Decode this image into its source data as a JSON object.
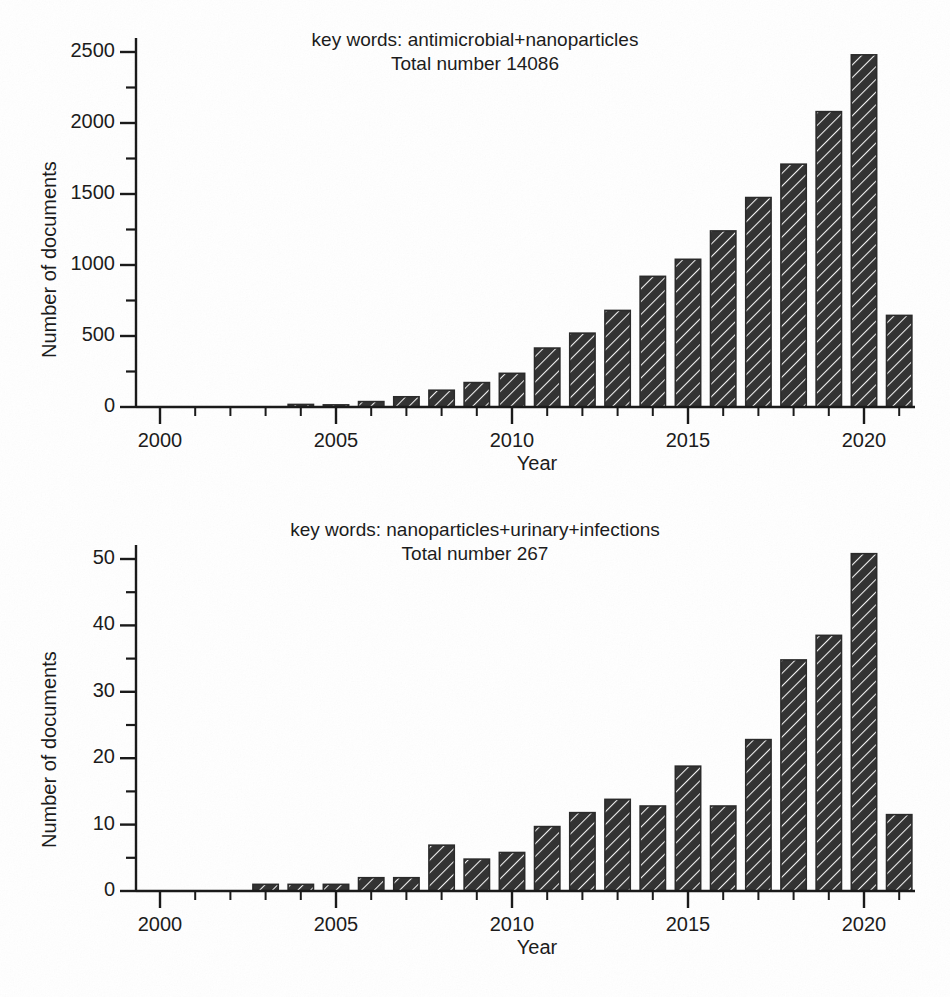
{
  "figure": {
    "background_color": "#ffffff",
    "bar_color": "#333333",
    "bar_hatch": "diagonal-45",
    "axis_color": "#1a1a1a"
  },
  "chart_data": [
    {
      "id": "chart-top",
      "type": "bar",
      "title": "key words: antimicrobial+nanoparticles",
      "subtitle": "Total number 14086",
      "xlabel": "Year",
      "ylabel": "Number of documents",
      "xlim": [
        1999,
        2022.4
      ],
      "ylim": [
        0,
        2600
      ],
      "ytick_labels": [
        "0",
        "500",
        "1000",
        "1500",
        "2000",
        "2500"
      ],
      "yticks": [
        0,
        500,
        1000,
        1500,
        2000,
        2500
      ],
      "yminor_step": 250,
      "xtick_labels": [
        "2000",
        "2005",
        "2010",
        "2015",
        "2020"
      ],
      "xticks": [
        2000,
        2005,
        2010,
        2015,
        2020
      ],
      "xminor_step": 1,
      "grid": false,
      "legend": "none",
      "categories": [
        2004,
        2005,
        2006,
        2007,
        2008,
        2009,
        2010,
        2011,
        2012,
        2013,
        2014,
        2015,
        2016,
        2017,
        2018,
        2019,
        2020,
        2021
      ],
      "values": [
        18,
        15,
        38,
        72,
        118,
        172,
        237,
        415,
        520,
        680,
        920,
        1040,
        1240,
        1475,
        1710,
        2080,
        2480,
        645
      ]
    },
    {
      "id": "chart-bottom",
      "type": "bar",
      "title": "key words: nanoparticles+urinary+infections",
      "subtitle": "Total number 267",
      "xlabel": "Year",
      "ylabel": "Number of documents",
      "xlim": [
        1999,
        2022.4
      ],
      "ylim": [
        0,
        53
      ],
      "ytick_labels": [
        "0",
        "10",
        "20",
        "30",
        "40",
        "50"
      ],
      "yticks": [
        0,
        10,
        20,
        30,
        40,
        50
      ],
      "yminor_step": 5,
      "xtick_labels": [
        "2000",
        "2005",
        "2010",
        "2015",
        "2020"
      ],
      "xticks": [
        2000,
        2005,
        2010,
        2015,
        2020
      ],
      "xminor_step": 1,
      "grid": false,
      "legend": "none",
      "categories": [
        2003,
        2004,
        2005,
        2006,
        2007,
        2008,
        2009,
        2010,
        2011,
        2012,
        2013,
        2014,
        2015,
        2016,
        2017,
        2018,
        2019,
        2020,
        2021
      ],
      "values": [
        1.0,
        1.0,
        1.0,
        2.0,
        2.0,
        6.9,
        4.8,
        5.8,
        9.7,
        11.8,
        13.8,
        12.8,
        18.8,
        12.8,
        22.8,
        34.8,
        38.5,
        50.8,
        11.5
      ]
    }
  ]
}
